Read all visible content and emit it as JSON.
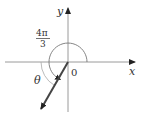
{
  "diagram": {
    "type": "angle-in-standard-position",
    "axes": {
      "x_label": "x",
      "y_label": "y",
      "origin_label": "0"
    },
    "angle_label": {
      "numerator": "4π",
      "denominator": "3"
    },
    "reference_angle_label": "θ",
    "colors": {
      "axis": "#9a9a9a",
      "ray": "#444444",
      "arc": "#777777",
      "ref_arc": "#aaaaaa"
    }
  }
}
